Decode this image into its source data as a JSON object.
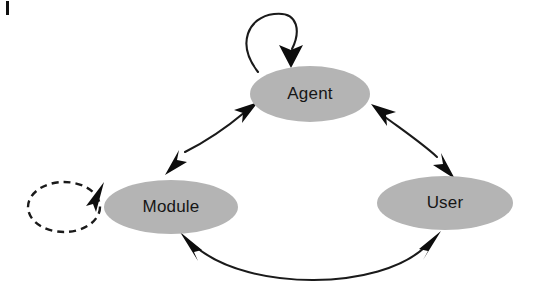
{
  "diagram": {
    "background_color": "#ffffff",
    "node_fill_color": "#b4b4b4",
    "edge_color": "#1a1a1a",
    "label_color": "#161616",
    "nodes": [
      {
        "id": "agent",
        "label": "Agent",
        "shape": "ellipse",
        "cx": 310,
        "cy": 94,
        "rx": 60,
        "ry": 28
      },
      {
        "id": "module",
        "label": "Module",
        "shape": "ellipse",
        "cx": 171,
        "cy": 207,
        "rx": 67,
        "ry": 27
      },
      {
        "id": "user",
        "label": "User",
        "shape": "ellipse",
        "cx": 445,
        "cy": 203,
        "rx": 68,
        "ry": 27
      }
    ],
    "edges": [
      {
        "id": "agent-self-loop",
        "from": "agent",
        "to": "agent",
        "type": "self-loop",
        "style": "solid",
        "arrows": "single",
        "direction": "clockwise"
      },
      {
        "id": "module-self-loop",
        "from": "module",
        "to": "module",
        "type": "self-loop",
        "style": "dashed",
        "arrows": "single",
        "direction": "clockwise"
      },
      {
        "id": "agent-module",
        "from": "agent",
        "to": "module",
        "type": "curve",
        "style": "solid",
        "arrows": "double"
      },
      {
        "id": "agent-user",
        "from": "agent",
        "to": "user",
        "type": "curve",
        "style": "solid",
        "arrows": "double"
      },
      {
        "id": "module-user",
        "from": "module",
        "to": "user",
        "type": "curve",
        "style": "solid",
        "arrows": "double"
      }
    ],
    "artifacts": [
      {
        "id": "page-edge-mark",
        "description": "scan-artifact-mark",
        "x": 6,
        "y": 1,
        "width": 3,
        "height": 14
      }
    ]
  }
}
